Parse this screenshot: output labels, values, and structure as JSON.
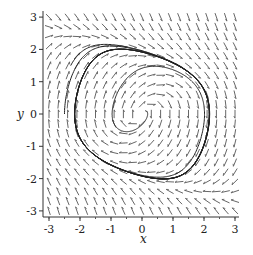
{
  "chart_data": {
    "type": "direction_field",
    "title": "",
    "xlabel": "x",
    "ylabel": "y",
    "xlim": [
      -3.2,
      3.2
    ],
    "ylim": [
      -3.2,
      3.2
    ],
    "x_ticks": [
      -3,
      -2,
      -1,
      0,
      1,
      2,
      3
    ],
    "y_ticks": [
      -3,
      -2,
      -1,
      0,
      1,
      2,
      3
    ],
    "x_tick_labels": [
      "-3",
      "-2",
      "-1",
      "0",
      "1",
      "2",
      "3"
    ],
    "y_tick_labels": [
      "-3",
      "-2",
      "-1",
      "0",
      "1",
      "2",
      "3"
    ],
    "grid": false,
    "legend": null,
    "system": {
      "dx": "y",
      "dy": "-x + mu*(y - y^3/3)",
      "mu": 1.0
    },
    "field_grid": {
      "nx": 21,
      "ny": 21
    },
    "trajectories": [
      {
        "name": "limit-cycle",
        "start": [
          -2.5,
          0.0
        ],
        "t_end": 20
      },
      {
        "name": "outer-approach",
        "start": [
          -2.3,
          1.5
        ],
        "t_end": 14
      },
      {
        "name": "spiral-from-origin",
        "start": [
          0.1,
          0.1
        ],
        "t_end": 16
      }
    ],
    "colors": {
      "arrow": "#555555",
      "trajectory": "#222222",
      "axis": "#333333"
    }
  },
  "axes": {
    "x_label": "x",
    "y_label": "y"
  }
}
